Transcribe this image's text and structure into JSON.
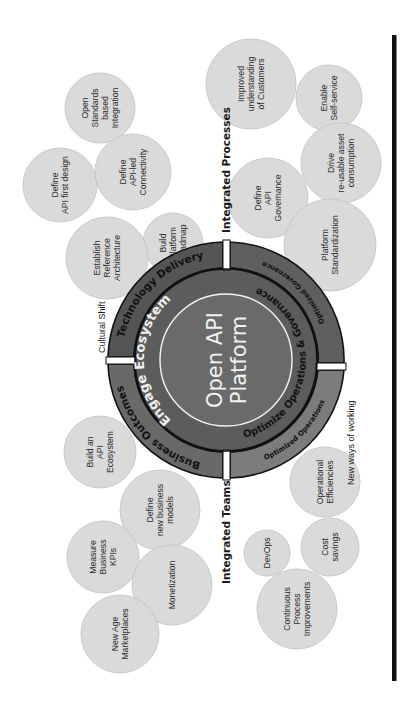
{
  "diagram": {
    "title_center": [
      "Open API",
      "Platform"
    ],
    "colors": {
      "bubble_fill": "#d9d9d9",
      "bubble_stroke": "#c8c8c8",
      "outer_ring_dark": "#555555",
      "outer_ring_light": "#6e6e6e",
      "outer_ring_lighter": "#7f7f7f",
      "inner_ring": "#5e5e5e",
      "center_fill": "#6a6a6a",
      "ring_outline": "#111111",
      "center_outline": "#f5f5f5",
      "side_bar": "#111111"
    },
    "outer_ring_segments": [
      {
        "label": "Technology Delivery",
        "quadrant": "top-left"
      },
      {
        "label": "Optimized Governance",
        "quadrant": "top-right"
      },
      {
        "label": "Optimized Operations",
        "quadrant": "bottom-right"
      },
      {
        "label": "Business Outcomes",
        "quadrant": "bottom-left"
      }
    ],
    "inner_ring_segments": [
      {
        "label": "Engage Ecosystem",
        "half": "left"
      },
      {
        "label": "Optimize Operations & Governance",
        "half": "right"
      }
    ],
    "section_labels": [
      {
        "label": "Integrated Processes"
      },
      {
        "label": "Integrated Teams"
      }
    ],
    "minor_labels": [
      {
        "label": "Cultural Shift"
      },
      {
        "label": "New ways of working"
      }
    ],
    "bubbles": [
      {
        "lines": [
          "Open",
          "Standards",
          "based",
          "Integration"
        ],
        "cx": 100,
        "cy": 108,
        "r": 35
      },
      {
        "lines": [
          "Define",
          "API first design"
        ],
        "cx": 60,
        "cy": 185,
        "r": 37
      },
      {
        "lines": [
          "Define",
          "API-led",
          "Connectivity"
        ],
        "cx": 133,
        "cy": 172,
        "r": 38
      },
      {
        "lines": [
          "Build",
          "Platform",
          "Roadmap"
        ],
        "cx": 173,
        "cy": 243,
        "r": 30
      },
      {
        "lines": [
          "Establish",
          "Reference",
          "Architecture"
        ],
        "cx": 107,
        "cy": 258,
        "r": 41
      },
      {
        "lines": [
          "Improved",
          "understanding",
          "of Customers"
        ],
        "cx": 251,
        "cy": 84,
        "r": 45
      },
      {
        "lines": [
          "Enable",
          "Self-service"
        ],
        "cx": 329,
        "cy": 98,
        "r": 33
      },
      {
        "lines": [
          "Drive",
          "re-usable asset",
          "consumption"
        ],
        "cx": 341,
        "cy": 163,
        "r": 40
      },
      {
        "lines": [
          "Define",
          "API",
          "Governance"
        ],
        "cx": 268,
        "cy": 198,
        "r": 40
      },
      {
        "lines": [
          "Platform",
          "Standardization"
        ],
        "cx": 330,
        "cy": 245,
        "r": 46
      },
      {
        "lines": [
          "Build an",
          "API",
          "Ecosystem"
        ],
        "cx": 100,
        "cy": 452,
        "r": 36
      },
      {
        "lines": [
          "Define",
          "new business",
          "models"
        ],
        "cx": 160,
        "cy": 510,
        "r": 40
      },
      {
        "lines": [
          "Measure",
          "Business",
          "KPIs"
        ],
        "cx": 103,
        "cy": 557,
        "r": 36
      },
      {
        "lines": [
          "Monetization"
        ],
        "cx": 172,
        "cy": 585,
        "r": 40
      },
      {
        "lines": [
          "New Age",
          "Marketplaces"
        ],
        "cx": 120,
        "cy": 634,
        "r": 39
      },
      {
        "lines": [
          "Operational",
          "Efficiencies"
        ],
        "cx": 325,
        "cy": 482,
        "r": 35
      },
      {
        "lines": [
          "Cost",
          "savings"
        ],
        "cx": 330,
        "cy": 547,
        "r": 29
      },
      {
        "lines": [
          "DevOps"
        ],
        "cx": 267,
        "cy": 553,
        "r": 23
      },
      {
        "lines": [
          "Continuous",
          "Process",
          "Improvements"
        ],
        "cx": 297,
        "cy": 609,
        "r": 40
      }
    ]
  }
}
